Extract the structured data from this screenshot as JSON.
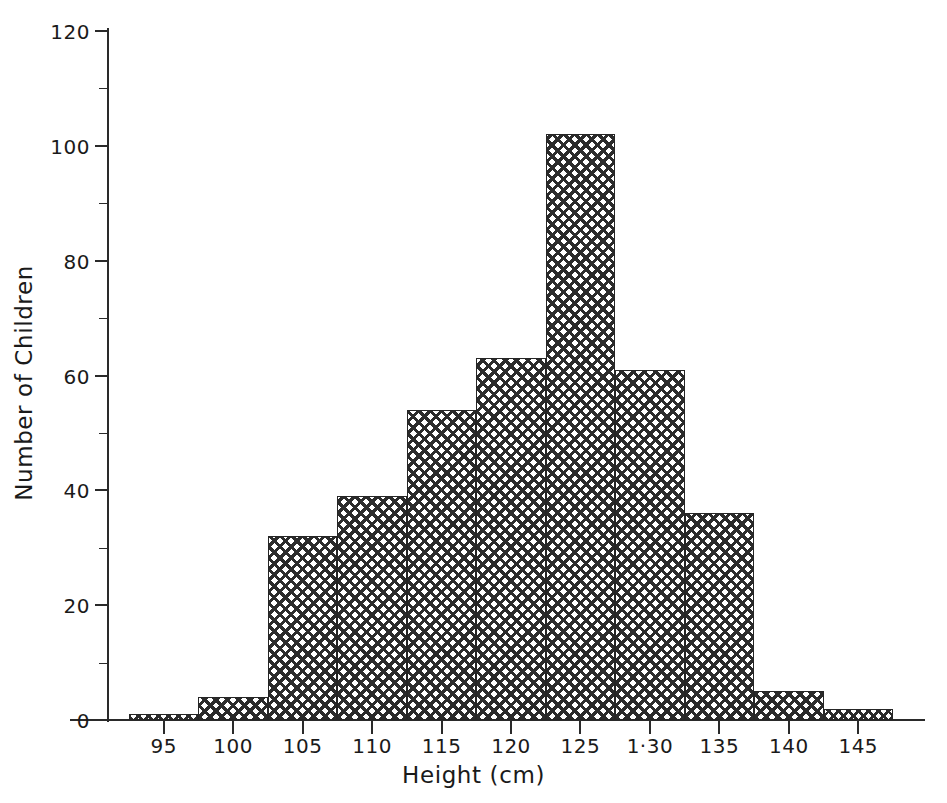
{
  "chart_data": {
    "type": "bar",
    "title": "",
    "subtitle": "",
    "xlabel": "Height (cm)",
    "ylabel": "Number of Children",
    "xlim": [
      92.5,
      147.5
    ],
    "ylim": [
      0,
      120
    ],
    "grid": false,
    "legend": null,
    "bin_width": 5,
    "bin_edges": [
      92.5,
      97.5,
      102.5,
      107.5,
      112.5,
      117.5,
      122.5,
      127.5,
      132.5,
      137.5,
      142.5,
      147.5
    ],
    "bin_centers": [
      95,
      100,
      105,
      110,
      115,
      120,
      125,
      130,
      135,
      140,
      145
    ],
    "categories": [
      "92.5-97.5",
      "97.5-102.5",
      "102.5-107.5",
      "107.5-112.5",
      "112.5-117.5",
      "117.5-122.5",
      "122.5-127.5",
      "127.5-132.5",
      "132.5-137.5",
      "137.5-142.5",
      "142.5-147.5"
    ],
    "values": [
      1,
      4,
      32,
      39,
      54,
      63,
      102,
      61,
      36,
      5,
      2
    ],
    "x_ticks": [
      95,
      100,
      105,
      110,
      115,
      120,
      125,
      130,
      135,
      140,
      145
    ],
    "x_tick_labels": [
      "95",
      "100",
      "105",
      "110",
      "115",
      "120",
      "125",
      "1·30",
      "135",
      "140",
      "145"
    ],
    "y_ticks": [
      0,
      20,
      40,
      60,
      80,
      100,
      120
    ],
    "y_tick_labels": [
      "0",
      "20",
      "40",
      "60",
      "80",
      "100",
      "120"
    ],
    "y_minor_ticks": [
      10,
      30,
      50,
      70,
      90,
      110
    ],
    "bar_fill": "crosshatch",
    "bar_color": "#2b2b2b",
    "axis_color": "#2a2a2a",
    "background": "#ffffff"
  }
}
